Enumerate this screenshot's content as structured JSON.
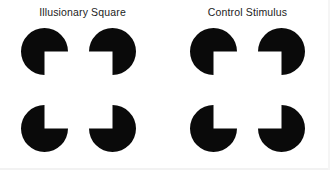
{
  "figure": {
    "background_color": "#ffffff",
    "inducer_color": "#0a0a0a",
    "title_color": "#1c1c1c",
    "inducer_diameter_px": 47,
    "panel_count": 2
  },
  "panels": [
    {
      "id": "illusory-square",
      "title": "Illusionary Square",
      "description": "Four pac-man inducers with wedges oriented inward, generating an illusory (subjective) square contour at the center.",
      "illusory_contour": "yes",
      "inducers": [
        {
          "position": "top-left",
          "missing_quadrant": "bottom-right",
          "wedge_start_deg": 0,
          "wedge_end_deg": 90
        },
        {
          "position": "top-right",
          "missing_quadrant": "bottom-left",
          "wedge_start_deg": 90,
          "wedge_end_deg": 180
        },
        {
          "position": "bottom-left",
          "missing_quadrant": "top-right",
          "wedge_start_deg": 270,
          "wedge_end_deg": 360
        },
        {
          "position": "bottom-right",
          "missing_quadrant": "top-left",
          "wedge_start_deg": 180,
          "wedge_end_deg": 270
        }
      ]
    },
    {
      "id": "control-stimulus",
      "title": "Control Stimulus",
      "description": "Identical pac-man inducers rotated 180 degrees so wedges point outward; no illusory contour is formed.",
      "illusory_contour": "no",
      "inducers": [
        {
          "position": "top-left",
          "missing_quadrant": "top-left",
          "wedge_start_deg": 180,
          "wedge_end_deg": 270
        },
        {
          "position": "top-right",
          "missing_quadrant": "top-right",
          "wedge_start_deg": 270,
          "wedge_end_deg": 360
        },
        {
          "position": "bottom-left",
          "missing_quadrant": "bottom-left",
          "wedge_start_deg": 90,
          "wedge_end_deg": 180
        },
        {
          "position": "bottom-right",
          "missing_quadrant": "bottom-right",
          "wedge_start_deg": 0,
          "wedge_end_deg": 90
        }
      ]
    }
  ]
}
